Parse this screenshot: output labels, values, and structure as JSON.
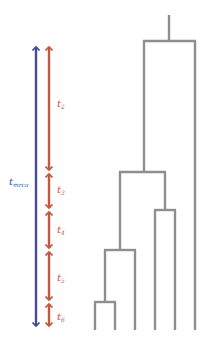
{
  "colors": {
    "tmrca_arrow": "#4a4a9c",
    "interval_arrow": "#c8553d",
    "tree": "#8e8e93"
  },
  "labels": {
    "tmrca": {
      "base": "t",
      "sub": "mrca"
    },
    "t2": {
      "base": "t",
      "sub": "2"
    },
    "t3": {
      "base": "t",
      "sub": "3"
    },
    "t4": {
      "base": "t",
      "sub": "4"
    },
    "t5": {
      "base": "t",
      "sub": "5"
    },
    "t6": {
      "base": "t",
      "sub": "6"
    }
  },
  "tree": {
    "leaves": 6,
    "coalescent_events": 5
  }
}
